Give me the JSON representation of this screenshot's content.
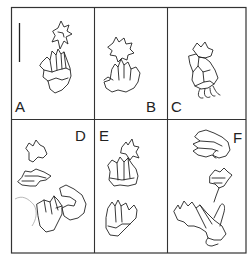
{
  "figure": {
    "panels": [
      {
        "id": "A",
        "label": "A",
        "label_pos": "bottom-left"
      },
      {
        "id": "B",
        "label": "B",
        "label_pos": "bottom-right"
      },
      {
        "id": "C",
        "label": "C",
        "label_pos": "bottom-left"
      },
      {
        "id": "D",
        "label": "D",
        "label_pos": "top-right"
      },
      {
        "id": "E",
        "label": "E",
        "label_pos": "top-left"
      },
      {
        "id": "F",
        "label": "F",
        "label_pos": "top-right"
      }
    ],
    "scale_bar": {
      "panel": "A",
      "orientation": "vertical"
    },
    "colors": {
      "line": "#222222",
      "background": "#ffffff",
      "frame": "#333333"
    }
  }
}
